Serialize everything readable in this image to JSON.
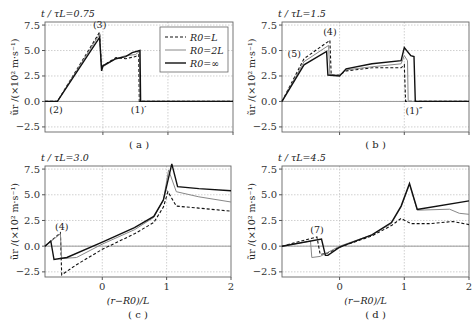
{
  "chart_data": [
    {
      "type": "line",
      "panel": "a",
      "title": "t/τL=0.75",
      "caption": "( a )",
      "xlabel": "",
      "ylabel": "ũr /(×10² m·s⁻¹)",
      "xlim": [
        -0.89,
        2.0
      ],
      "ylim": [
        -3.0,
        7.8
      ],
      "yticks": [
        "7.5",
        "5.0",
        "2.5",
        "0.0",
        "-2.5"
      ],
      "xticks": [],
      "grid": true,
      "legend": {
        "position": "upper right",
        "entries": [
          "R0=L",
          "R0=2L",
          "R0=∞"
        ]
      },
      "annotations": [
        {
          "text": "(3)",
          "x": -0.05,
          "y": 7.2
        },
        {
          "text": "(2)",
          "x": -0.72,
          "y": -1.1
        },
        {
          "text": "(1)′",
          "x": 0.55,
          "y": -1.1
        }
      ],
      "series": [
        {
          "name": "R0=L",
          "style": "dashed",
          "x": [
            -0.89,
            -0.7,
            -0.05,
            -0.02,
            0.0,
            0.2,
            0.35,
            0.5,
            0.55,
            0.56,
            2.0
          ],
          "y": [
            0,
            0,
            6.8,
            3.3,
            3.5,
            4.3,
            4.2,
            4.4,
            4.6,
            0,
            0
          ]
        },
        {
          "name": "R0=2L",
          "style": "gray",
          "x": [
            -0.89,
            -0.7,
            -0.05,
            -0.02,
            0.0,
            0.2,
            0.35,
            0.5,
            0.56,
            0.57,
            2.0
          ],
          "y": [
            0,
            0,
            6.6,
            3.1,
            3.4,
            4.2,
            4.5,
            4.6,
            4.9,
            0,
            0
          ]
        },
        {
          "name": "R0=∞",
          "style": "solid",
          "x": [
            -0.89,
            -0.7,
            -0.05,
            -0.02,
            0.0,
            0.2,
            0.35,
            0.45,
            0.57,
            0.58,
            2.0
          ],
          "y": [
            0,
            0,
            6.3,
            3.0,
            3.5,
            4.2,
            4.4,
            4.8,
            5.0,
            0,
            0
          ]
        }
      ]
    },
    {
      "type": "line",
      "panel": "b",
      "title": "t/τL=1.5",
      "caption": "( b )",
      "xlabel": "",
      "ylabel": "ũr /(×10² m·s⁻¹)",
      "xlim": [
        -0.89,
        2.0
      ],
      "ylim": [
        -3.0,
        7.8
      ],
      "yticks": [
        "7.5",
        "5.0",
        "2.5",
        "0.0",
        "-2.5"
      ],
      "xticks": [],
      "grid": true,
      "annotations": [
        {
          "text": "(4)",
          "x": -0.15,
          "y": 6.5
        },
        {
          "text": "(5)",
          "x": -0.7,
          "y": 4.4
        },
        {
          "text": "(1)″",
          "x": 1.15,
          "y": -1.2
        }
      ],
      "series": [
        {
          "name": "R0=L",
          "style": "dashed",
          "x": [
            -0.89,
            -0.55,
            -0.15,
            -0.13,
            0.0,
            0.1,
            0.5,
            0.95,
            1.0,
            1.02,
            2.0
          ],
          "y": [
            0,
            4.2,
            6.0,
            2.6,
            2.6,
            3.0,
            3.3,
            3.3,
            3.6,
            0,
            0
          ]
        },
        {
          "name": "R0=2L",
          "style": "gray",
          "x": [
            -0.89,
            -0.55,
            -0.17,
            -0.15,
            0.0,
            0.1,
            0.5,
            0.95,
            1.0,
            1.05,
            1.06,
            2.0
          ],
          "y": [
            0,
            3.9,
            5.5,
            2.6,
            2.6,
            3.1,
            3.4,
            3.7,
            4.5,
            4.0,
            0,
            0
          ]
        },
        {
          "name": "R0=∞",
          "style": "solid",
          "x": [
            -0.89,
            -0.55,
            -0.2,
            -0.18,
            0.0,
            0.1,
            0.5,
            0.95,
            1.0,
            1.1,
            1.15,
            1.17,
            2.0
          ],
          "y": [
            0,
            3.6,
            4.9,
            2.6,
            2.5,
            3.2,
            3.7,
            4.0,
            5.3,
            4.5,
            4.4,
            0,
            0
          ]
        }
      ]
    },
    {
      "type": "line",
      "panel": "c",
      "title": "t/τL=3.0",
      "caption": "( c )",
      "xlabel": "(r−R0)/L",
      "ylabel": "ũr /(×10² m·s⁻¹)",
      "xlim": [
        -0.89,
        2.0
      ],
      "ylim": [
        -3.0,
        7.8
      ],
      "yticks": [
        "7.5",
        "5.0",
        "2.5",
        "0.0",
        "-2.5"
      ],
      "xticks": [
        "0",
        "1",
        "2"
      ],
      "grid": true,
      "annotations": [
        {
          "text": "(4)",
          "x": -0.63,
          "y": 1.6
        }
      ],
      "series": [
        {
          "name": "R0=L",
          "style": "dashed",
          "x": [
            -0.89,
            -0.65,
            -0.63,
            -0.4,
            0.0,
            0.5,
            0.8,
            0.95,
            1.02,
            1.15,
            1.5,
            2.0
          ],
          "y": [
            0,
            1.3,
            -2.8,
            -1.8,
            -0.3,
            1.2,
            2.3,
            3.8,
            5.3,
            3.9,
            3.7,
            3.4
          ]
        },
        {
          "name": "R0=2L",
          "style": "gray",
          "x": [
            -0.89,
            -0.65,
            -0.63,
            -0.4,
            0.0,
            0.5,
            0.8,
            0.95,
            1.03,
            1.15,
            1.5,
            2.0
          ],
          "y": [
            0,
            1.2,
            -1.2,
            -1.1,
            0.2,
            1.6,
            2.8,
            4.5,
            7.4,
            5.3,
            4.8,
            4.3
          ]
        },
        {
          "name": "R0=∞",
          "style": "solid",
          "x": [
            -0.89,
            -0.8,
            -0.75,
            -0.55,
            0.0,
            0.5,
            0.8,
            0.95,
            1.08,
            1.17,
            1.5,
            2.0
          ],
          "y": [
            0,
            0.5,
            -1.3,
            -1.1,
            0.4,
            1.8,
            2.9,
            4.5,
            8.0,
            5.8,
            5.6,
            5.4
          ]
        }
      ]
    },
    {
      "type": "line",
      "panel": "d",
      "title": "t/τL=4.5",
      "caption": "( d )",
      "xlabel": "(r−R0)/L",
      "ylabel": "ũr /(×10² m·s⁻¹)",
      "xlim": [
        -0.89,
        2.0
      ],
      "ylim": [
        -3.0,
        7.8
      ],
      "yticks": [
        "7.5",
        "5.0",
        "2.5",
        "0.0",
        "-2.5"
      ],
      "xticks": [
        "0",
        "1",
        "2"
      ],
      "grid": true,
      "annotations": [
        {
          "text": "(7)",
          "x": -0.35,
          "y": 1.3
        }
      ],
      "series": [
        {
          "name": "R0=L",
          "style": "dashed",
          "x": [
            -0.89,
            -0.35,
            -0.3,
            -0.2,
            0.0,
            0.5,
            0.8,
            0.95,
            1.1,
            1.4,
            1.75,
            2.0
          ],
          "y": [
            0,
            0.9,
            -0.8,
            -0.7,
            -0.1,
            1.0,
            2.0,
            2.7,
            2.2,
            2.2,
            2.4,
            2.1
          ]
        },
        {
          "name": "R0=2L",
          "style": "gray",
          "x": [
            -0.89,
            -0.45,
            -0.43,
            -0.3,
            0.0,
            0.5,
            0.8,
            0.95,
            1.08,
            1.2,
            1.7,
            1.85,
            2.0
          ],
          "y": [
            0,
            0.5,
            -1.1,
            -1.0,
            0.0,
            1.1,
            2.2,
            3.8,
            6.0,
            3.5,
            3.6,
            3.2,
            3.1
          ]
        },
        {
          "name": "R0=∞",
          "style": "solid",
          "x": [
            -0.89,
            -0.28,
            -0.22,
            -0.18,
            0.0,
            0.5,
            0.8,
            0.95,
            1.08,
            1.2,
            1.22,
            2.0
          ],
          "y": [
            0,
            0.7,
            -0.9,
            -0.9,
            -0.1,
            1.1,
            2.3,
            3.9,
            6.1,
            3.6,
            3.6,
            4.4
          ]
        }
      ]
    }
  ],
  "panels": {
    "a": {
      "title": "t / τL=0.75",
      "caption": "( a )"
    },
    "b": {
      "title": "t / τL=1.5",
      "caption": "( b )"
    },
    "c": {
      "title": "t / τL=3.0",
      "caption": "( c )",
      "xlabel": "(r−R0)/L"
    },
    "d": {
      "title": "t / τL=4.5",
      "caption": "( d )",
      "xlabel": "(r−R0)/L"
    }
  },
  "legend": [
    "R0=L",
    "R0=2L",
    "R0=∞"
  ],
  "ylabel": "ũr /(×10² m·s⁻¹)"
}
